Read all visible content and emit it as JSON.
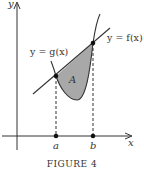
{
  "figure": {
    "caption": "FIGURE 4",
    "axes": {
      "x_label": "x",
      "y_label": "y"
    },
    "curves": {
      "f_label": "y = f(x)",
      "g_label": "y = g(x)"
    },
    "region_label": "A",
    "points": {
      "a_label": "a",
      "b_label": "b"
    },
    "colors": {
      "stroke": "#333333",
      "shade": "#a8a8a8",
      "background": "#ffffff"
    }
  }
}
